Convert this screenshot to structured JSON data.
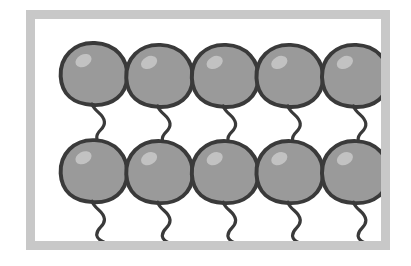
{
  "illustration": {
    "title": "Ten balloons in a frame",
    "subject": "balloon",
    "subject_count": 10,
    "rows": 2,
    "columns": 5,
    "frame": {
      "border_color": "#c8c8c8",
      "background_color": "#ffffff",
      "border_width_px": 9,
      "x": 26,
      "y": 10,
      "width": 364,
      "height": 240
    },
    "colors": {
      "balloon_fill": "#9a9a9a",
      "balloon_outline": "#3a3a3a",
      "balloon_highlight": "#c2c2c2",
      "tail_stroke": "#3a3a3a",
      "canvas": "#ffffff"
    },
    "balloons": [
      {
        "id": "balloon-1",
        "row": 1,
        "column": 1,
        "cx": 62,
        "cy": 60
      },
      {
        "id": "balloon-2",
        "row": 1,
        "column": 2,
        "cx": 131,
        "cy": 62
      },
      {
        "id": "balloon-3",
        "row": 1,
        "column": 3,
        "cx": 200,
        "cy": 62
      },
      {
        "id": "balloon-4",
        "row": 1,
        "column": 4,
        "cx": 268,
        "cy": 62
      },
      {
        "id": "balloon-5",
        "row": 1,
        "column": 5,
        "cx": 337,
        "cy": 62
      },
      {
        "id": "balloon-6",
        "row": 2,
        "column": 1,
        "cx": 62,
        "cy": 165
      },
      {
        "id": "balloon-7",
        "row": 2,
        "column": 2,
        "cx": 131,
        "cy": 166
      },
      {
        "id": "balloon-8",
        "row": 2,
        "column": 3,
        "cx": 200,
        "cy": 166
      },
      {
        "id": "balloon-9",
        "row": 2,
        "column": 4,
        "cx": 268,
        "cy": 166
      },
      {
        "id": "balloon-10",
        "row": 2,
        "column": 5,
        "cx": 337,
        "cy": 166
      }
    ]
  }
}
